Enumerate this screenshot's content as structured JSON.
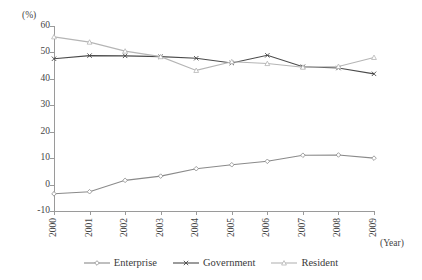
{
  "chart_data": {
    "type": "line",
    "title": "",
    "subtitle": "",
    "xlabel": "(Year)",
    "ylabel": "(%)",
    "categories": [
      "2000",
      "2001",
      "2002",
      "2003",
      "2004",
      "2005",
      "2006",
      "2007",
      "2008",
      "2009"
    ],
    "x": [
      2000,
      2001,
      2002,
      2003,
      2004,
      2005,
      2006,
      2007,
      2008,
      2009
    ],
    "ylim": [
      -10,
      60
    ],
    "xlim": [
      2000,
      2009
    ],
    "yticks": [
      -10,
      0,
      10,
      20,
      30,
      40,
      50,
      60
    ],
    "ytick_labels": [
      "-10",
      "0",
      "10",
      "20",
      "30",
      "40",
      "50",
      "60"
    ],
    "xtick_labels": [
      "2000",
      "2001",
      "2002",
      "2003",
      "2004",
      "2005",
      "2006",
      "2007",
      "2008",
      "2009"
    ],
    "grid": false,
    "legend_position": "bottom",
    "series": [
      {
        "name": "Enterprise",
        "color": "#8a8a8a",
        "marker": "diamond",
        "values": [
          -3.5,
          -2.7,
          1.6,
          3.2,
          6.0,
          7.5,
          8.8,
          11.1,
          11.2,
          10.0
        ]
      },
      {
        "name": "Government",
        "color": "#4a4a4a",
        "marker": "cross",
        "values": [
          47.6,
          48.8,
          48.7,
          48.4,
          47.8,
          46.0,
          48.9,
          44.6,
          44.1,
          41.9
        ]
      },
      {
        "name": "Resident",
        "color": "#b5b5b5",
        "marker": "triangle",
        "values": [
          55.9,
          53.9,
          50.5,
          48.4,
          43.2,
          46.5,
          45.8,
          44.4,
          44.7,
          48.1
        ]
      }
    ]
  },
  "axes": {
    "y_unit": "(%)",
    "x_unit": "(Year)"
  },
  "legend": {
    "items": [
      {
        "label": "Enterprise"
      },
      {
        "label": "Government"
      },
      {
        "label": "Resident"
      }
    ]
  }
}
